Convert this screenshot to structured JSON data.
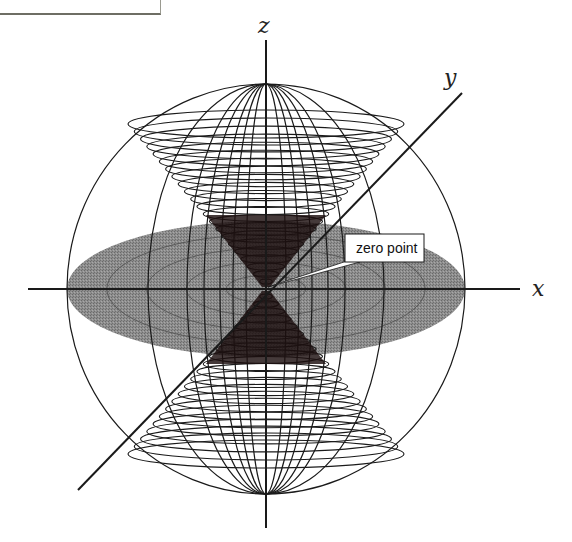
{
  "diagram": {
    "title": "",
    "axes": {
      "x_label": "x",
      "y_label": "y",
      "z_label": "z"
    },
    "callout": {
      "label": "zero point"
    },
    "colors": {
      "line": "#1a1a1a",
      "disc_fill": "#8a8a8a",
      "disc_ring": "#5a5a5a",
      "dense_core": "#1c0f0f",
      "background": "#ffffff"
    },
    "geometry": {
      "center": [
        266,
        289
      ],
      "sphere_rx": 199,
      "sphere_ry": 205,
      "disc_rx": 199,
      "disc_ry": 68,
      "disc_ring_scales": [
        0.2,
        0.4,
        0.6,
        0.8
      ],
      "meridian_rx": [
        20,
        33,
        46,
        62,
        79,
        118
      ],
      "cone_apex_height": 165,
      "cone_ring_count": 22
    }
  }
}
